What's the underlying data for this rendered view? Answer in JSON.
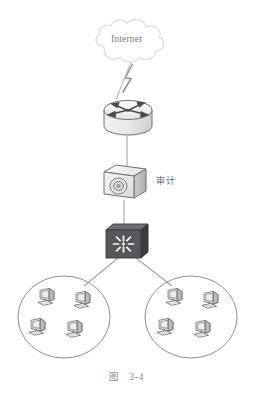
{
  "figure": {
    "caption_prefix": "图",
    "caption_number": "3-4",
    "top_clipped_artifact": "· ··· ···· · ·· ·"
  },
  "nodes": {
    "cloud": {
      "label": "Internet",
      "type": "cloud",
      "icon": "cloud-icon"
    },
    "router": {
      "label": "",
      "type": "router",
      "icon": "router-icon"
    },
    "audit": {
      "label": "审计",
      "type": "appliance",
      "icon": "audit-appliance-icon"
    },
    "switch": {
      "label": "",
      "type": "switch",
      "icon": "switch-icon"
    },
    "lan_left": {
      "label": "",
      "type": "lan-group",
      "icon": "lan-ellipse-icon",
      "host_count": 4
    },
    "lan_right": {
      "label": "",
      "type": "lan-group",
      "icon": "lan-ellipse-icon",
      "host_count": 4
    }
  },
  "links": [
    {
      "from": "cloud",
      "to": "router",
      "style": "lightning"
    },
    {
      "from": "router",
      "to": "audit",
      "style": "line"
    },
    {
      "from": "audit",
      "to": "switch",
      "style": "line"
    },
    {
      "from": "switch",
      "to": "lan_left",
      "style": "line"
    },
    {
      "from": "switch",
      "to": "lan_right",
      "style": "line"
    }
  ],
  "colors": {
    "line": "#9a9a9f",
    "outline": "#6f6f74",
    "switch_body": "#5a5a5e",
    "switch_side": "#3c3c40",
    "switch_star": "#ffffff",
    "cloud_stroke": "#d8d8dc",
    "device_light": "#f2f2f2",
    "device_mid": "#d6d6d6",
    "device_dark": "#9e9ea2",
    "text": "#6e6e73",
    "background": "#ffffff"
  }
}
